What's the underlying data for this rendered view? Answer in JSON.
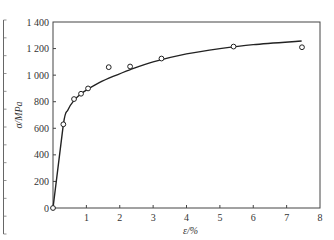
{
  "chart_data": {
    "type": "scatter",
    "title": "",
    "xlabel": "ε/%",
    "ylabel": "σ/MPa",
    "xlim": [
      0,
      8
    ],
    "ylim": [
      0,
      1400
    ],
    "x_ticks": [
      0,
      1,
      2,
      3,
      4,
      5,
      6,
      7,
      8
    ],
    "x_tick_labels": [
      "0",
      "1",
      "2",
      "3",
      "4",
      "5",
      "6",
      "7",
      "8"
    ],
    "y_ticks": [
      0,
      200,
      400,
      600,
      800,
      1000,
      1200,
      1400
    ],
    "y_tick_labels": [
      "0",
      "200",
      "400",
      "600",
      "800",
      "1 000",
      "1 200",
      "1 400"
    ],
    "grid": false,
    "legend": "none",
    "series": [
      {
        "name": "measured",
        "style": "open-circle-markers",
        "x": [
          0,
          0.31,
          0.63,
          0.84,
          1.05,
          1.67,
          2.31,
          3.25,
          5.41,
          7.46
        ],
        "y": [
          0,
          630,
          820,
          860,
          900,
          1060,
          1065,
          1125,
          1215,
          1210
        ]
      },
      {
        "name": "fitted curve",
        "style": "solid-line",
        "x": [
          0,
          0.31,
          0.45,
          0.63,
          0.84,
          1.05,
          1.4,
          1.8,
          2.3,
          3.0,
          4.0,
          5.0,
          6.0,
          7.45
        ],
        "y": [
          0,
          630,
          740,
          810,
          860,
          895,
          945,
          990,
          1040,
          1100,
          1160,
          1200,
          1230,
          1257
        ]
      }
    ]
  },
  "neighbor_fragment": {
    "description": "partial axis of adjacent figure at left edge"
  }
}
